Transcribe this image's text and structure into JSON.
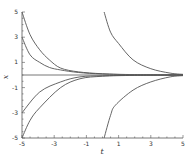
{
  "chart_data": {
    "type": "line",
    "title": "",
    "xlabel": "t",
    "ylabel": "x",
    "xlim": [
      -5,
      5
    ],
    "ylim": [
      -5,
      5
    ],
    "grid": false,
    "legend": "none",
    "xticks": [
      "-5",
      "-3",
      "-1",
      "1",
      "3",
      "5"
    ],
    "xtick_values": [
      -5,
      -3,
      -1,
      1,
      3,
      5
    ],
    "yticks": [
      "5",
      "3",
      "1",
      "-1",
      "-3",
      "-5"
    ],
    "ytick_values": [
      5,
      3,
      1,
      -1,
      -3,
      -5
    ],
    "series": [
      {
        "name": "x0=5 at t=-5",
        "x": [
          -5,
          -4.5,
          -3.9,
          -3.3,
          -2.6,
          -1.5,
          0,
          2,
          5
        ],
        "y": [
          5,
          3.2,
          2.0,
          1.2,
          0.55,
          0.25,
          0.1,
          0.03,
          0
        ]
      },
      {
        "name": "x0=3 at t=-5",
        "x": [
          -5,
          -4.5,
          -3.9,
          -3.3,
          -2.6,
          -1.5,
          0,
          2,
          5
        ],
        "y": [
          3,
          1.6,
          1.0,
          0.6,
          0.4,
          0.2,
          0.08,
          0.02,
          0
        ]
      },
      {
        "name": "x0=0",
        "x": [
          -5,
          5
        ],
        "y": [
          0,
          0
        ]
      },
      {
        "name": "x0=-3 at t=-5",
        "x": [
          -5,
          -3.9,
          -2.6,
          -1.4,
          0,
          2,
          5
        ],
        "y": [
          -3,
          -1.35,
          -0.55,
          -0.15,
          -0.06,
          -0.02,
          0
        ]
      },
      {
        "name": "x0=-5 at t=-5",
        "x": [
          -5,
          -4.5,
          -3.9,
          -2.6,
          -1.4,
          0,
          2,
          5
        ],
        "y": [
          -5,
          -3.6,
          -2.6,
          -1.0,
          -0.3,
          -0.1,
          -0.03,
          0
        ]
      },
      {
        "name": "x0=5 at t=0",
        "x": [
          0.1,
          0.5,
          1.0,
          1.9,
          3.0,
          4.2,
          5
        ],
        "y": [
          5,
          3.4,
          2.5,
          1.2,
          0.5,
          0.15,
          0.05
        ]
      },
      {
        "name": "x0=-5 at t=0",
        "x": [
          0.1,
          0.5,
          0.8,
          1.9,
          3.0,
          4.2,
          5
        ],
        "y": [
          -5,
          -3.2,
          -2.4,
          -1.2,
          -0.55,
          -0.15,
          -0.05
        ]
      }
    ]
  }
}
